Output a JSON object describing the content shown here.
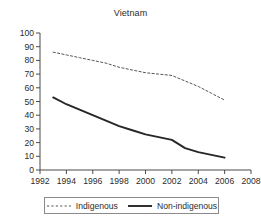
{
  "chart_data": {
    "type": "line",
    "title": "Vietnam",
    "xlabel": "",
    "ylabel": "",
    "xlim": [
      1992,
      2008
    ],
    "ylim": [
      0,
      100
    ],
    "grid": false,
    "legend_position": "bottom",
    "x_ticks": [
      "1992",
      "1994",
      "1996",
      "1998",
      "2000",
      "2002",
      "2004",
      "2006",
      "2008"
    ],
    "y_ticks": [
      "0",
      "10",
      "20",
      "30",
      "40",
      "50",
      "60",
      "70",
      "80",
      "90",
      "100"
    ],
    "series": [
      {
        "name": "Indigenous",
        "style": "dashed",
        "color": "#555555",
        "x": [
          1993,
          1994,
          1995,
          1996,
          1997,
          1998,
          1999,
          2000,
          2001,
          2002,
          2003,
          2004,
          2005,
          2006
        ],
        "values": [
          86,
          84,
          82,
          80,
          78,
          75,
          73,
          71,
          70,
          69,
          65,
          61,
          56,
          51
        ]
      },
      {
        "name": "Non-indigenous",
        "style": "solid",
        "color": "#262626",
        "x": [
          1993,
          1994,
          1995,
          1996,
          1997,
          1998,
          1999,
          2000,
          2001,
          2002,
          2003,
          2004,
          2005,
          2006
        ],
        "values": [
          53,
          48,
          44,
          40,
          36,
          32,
          29,
          26,
          24,
          22,
          16,
          13,
          11,
          9
        ]
      }
    ]
  },
  "legend": {
    "entries": [
      {
        "label": "Indigenous"
      },
      {
        "label": "Non-indigenous"
      }
    ]
  }
}
